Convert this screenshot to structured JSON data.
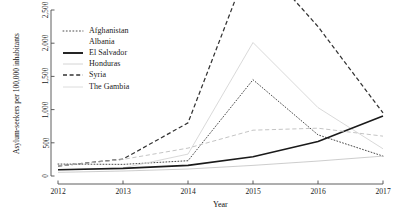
{
  "chart_data": {
    "type": "line",
    "title": "",
    "xlabel": "Year",
    "ylabel": "Asylum-seekers per 100,000 inhabitants",
    "x": [
      2012,
      2013,
      2014,
      2015,
      2016,
      2017
    ],
    "xtick_labels": [
      "2012",
      "2013",
      "2014",
      "2015",
      "2016",
      "2017"
    ],
    "ytick_labels": [
      "0",
      "500",
      "1,000",
      "1,500",
      "2,000",
      "2,500"
    ],
    "ytick_values": [
      0,
      500,
      1000,
      1500,
      2000,
      2500
    ],
    "xlim": [
      2012,
      2017
    ],
    "ylim": [
      0,
      2500
    ],
    "grid": false,
    "legend_position": "top-left",
    "series": [
      {
        "name": "Afghanistan",
        "style": "dotted",
        "color": "#4a4a4a",
        "values": [
          180,
          175,
          230,
          1450,
          620,
          300
        ]
      },
      {
        "name": "Albania",
        "style": "solid",
        "color": "#d2d2d2",
        "values": [
          90,
          120,
          330,
          2010,
          1030,
          410
        ]
      },
      {
        "name": "El Salvador",
        "style": "solid",
        "color": "#1a1a1a",
        "values": [
          95,
          115,
          160,
          290,
          520,
          905
        ]
      },
      {
        "name": "Honduras",
        "style": "solid",
        "color": "#c4c4c4",
        "values": [
          55,
          75,
          105,
          160,
          225,
          300
        ]
      },
      {
        "name": "Syria",
        "style": "dashed",
        "color": "#333333",
        "values": [
          150,
          255,
          800,
          3350,
          2250,
          950
        ]
      },
      {
        "name": "The Gambia",
        "style": "dashed",
        "color": "#bdbdbd",
        "values": [
          150,
          250,
          420,
          690,
          720,
          600
        ]
      }
    ]
  },
  "legend": {
    "items": [
      {
        "label": "Afghanistan",
        "swatch": "dotted-dark"
      },
      {
        "label": "Albania",
        "swatch": "solid-light"
      },
      {
        "label": "El Salvador",
        "swatch": "solid-dark-thick"
      },
      {
        "label": "Honduras",
        "swatch": "solid-light"
      },
      {
        "label": "Syria",
        "swatch": "dashed-dark"
      },
      {
        "label": "The Gambia",
        "swatch": "dashed-light"
      }
    ]
  },
  "axes": {
    "y_title": "Asylum-seekers per 100,000 inhabitants",
    "x_title": "Year"
  }
}
